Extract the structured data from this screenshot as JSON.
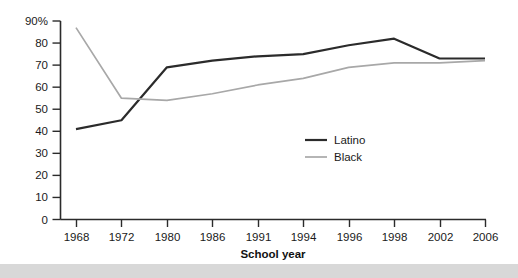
{
  "chart_data": {
    "type": "line",
    "title": "",
    "xlabel": "School year",
    "ylabel": "",
    "categories": [
      "1968",
      "1972",
      "1980",
      "1986",
      "1991",
      "1994",
      "1996",
      "1998",
      "2002",
      "2006"
    ],
    "ylim": [
      0,
      90
    ],
    "ytick_labels": [
      "0",
      "10",
      "20",
      "30",
      "40",
      "50",
      "60",
      "70",
      "80",
      "90%"
    ],
    "ytick_values": [
      0,
      10,
      20,
      30,
      40,
      50,
      60,
      70,
      80,
      90
    ],
    "grid": false,
    "legend_position": "center-right",
    "series": [
      {
        "name": "Latino",
        "color": "#2b2b2b",
        "values": [
          41,
          45,
          69,
          72,
          74,
          75,
          79,
          82,
          73,
          73
        ]
      },
      {
        "name": "Black",
        "color": "#a8a8a8",
        "values": [
          87,
          55,
          54,
          57,
          61,
          64,
          69,
          71,
          71,
          72
        ]
      }
    ]
  },
  "axis": {
    "x_label": "School year",
    "y_top_label": "90%"
  },
  "legend": {
    "items": [
      {
        "label": "Latino",
        "color": "#2b2b2b"
      },
      {
        "label": "Black",
        "color": "#a8a8a8"
      }
    ]
  }
}
